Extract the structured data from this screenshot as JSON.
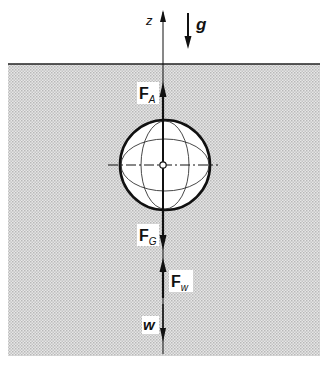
{
  "diagram": {
    "title": "",
    "axis": {
      "label": "z"
    },
    "gravity": {
      "label": "g"
    },
    "forces": [
      {
        "id": "buoyancy",
        "symbol": "F",
        "subscript": "A",
        "direction": "up"
      },
      {
        "id": "weight",
        "symbol": "F",
        "subscript": "G",
        "direction": "down"
      },
      {
        "id": "drag",
        "symbol": "F",
        "subscript": "w",
        "direction": "up"
      },
      {
        "id": "velocity",
        "symbol": "w",
        "subscript": "",
        "direction": "down"
      }
    ],
    "fluid": {
      "fill_color": "#d9d9d9",
      "surface_color": "#222222"
    },
    "sphere": {
      "fill_color": "#ffffff",
      "stroke_color": "#111111"
    }
  }
}
